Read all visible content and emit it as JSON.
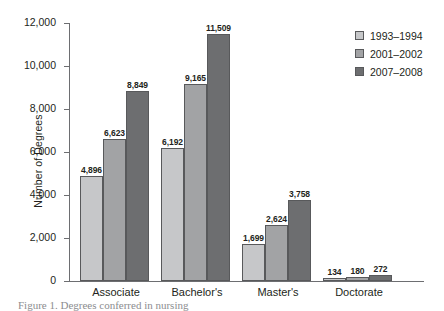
{
  "chart_data": {
    "type": "bar",
    "title": "",
    "xlabel": "",
    "ylabel": "Number of Degrees",
    "categories": [
      "Associate",
      "Bachelor's",
      "Master's",
      "Doctorate"
    ],
    "series": [
      {
        "name": "1993–1994",
        "color": "#c6c7c9",
        "values": [
          4896,
          6192,
          1699,
          134
        ]
      },
      {
        "name": "2001–2002",
        "color": "#a2a3a5",
        "values": [
          6623,
          9165,
          2624,
          180
        ]
      },
      {
        "name": "2007–2008",
        "color": "#6d6e70",
        "values": [
          8849,
          11509,
          3758,
          272
        ]
      }
    ],
    "value_labels": [
      [
        "4,896",
        "6,623",
        "8,849"
      ],
      [
        "6,192",
        "9,165",
        "11,509"
      ],
      [
        "1,699",
        "2,624",
        "3,758"
      ],
      [
        "134",
        "180",
        "272"
      ]
    ],
    "ylim": [
      0,
      12000
    ],
    "yticks": [
      0,
      2000,
      4000,
      6000,
      8000,
      10000,
      12000
    ],
    "ytick_labels": [
      "0",
      "2,000",
      "4,000",
      "6,000",
      "8,000",
      "10,000",
      "12,000"
    ],
    "grid": false,
    "legend_position": "right-top"
  },
  "caption": "Figure 1. Degrees conferred in nursing"
}
